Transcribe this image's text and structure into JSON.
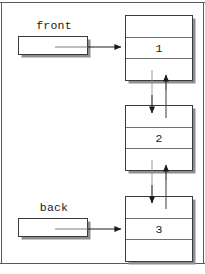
{
  "figure": {
    "kind": "linked-list-queue-diagram",
    "width": 205,
    "height": 274,
    "background": "#ffffff",
    "line_color": "#3b3b3b",
    "shadow_color": "#8e8e8e"
  },
  "pointers": [
    {
      "id": "front",
      "label": "front",
      "box_value": ""
    },
    {
      "id": "back",
      "label": "back",
      "box_value": ""
    }
  ],
  "nodes": [
    {
      "id": "node-1",
      "top_cell": "",
      "value": "1",
      "bottom_cell": ""
    },
    {
      "id": "node-2",
      "top_cell": "",
      "value": "2",
      "bottom_cell": ""
    },
    {
      "id": "node-3",
      "top_cell": "",
      "value": "3",
      "bottom_cell": ""
    }
  ],
  "connections": [
    {
      "id": "front-to-node-1",
      "from": "front",
      "to": "node-1",
      "direction": "right"
    },
    {
      "id": "node-1-to-node-2",
      "from": "node-1",
      "to": "node-2",
      "direction": "down"
    },
    {
      "id": "node-2-to-node-1",
      "from": "node-2",
      "to": "node-1",
      "direction": "up"
    },
    {
      "id": "node-2-to-node-3",
      "from": "node-2",
      "to": "node-3",
      "direction": "down"
    },
    {
      "id": "node-3-to-node-2",
      "from": "node-3",
      "to": "node-2",
      "direction": "up"
    },
    {
      "id": "back-to-node-3",
      "from": "back",
      "to": "node-3",
      "direction": "right"
    }
  ]
}
